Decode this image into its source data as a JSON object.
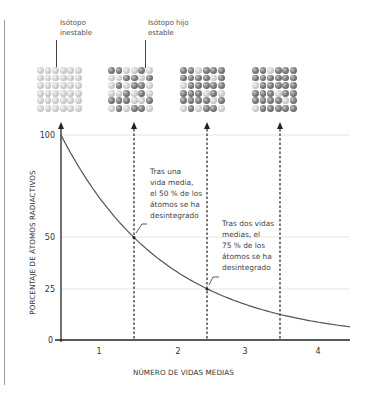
{
  "labels": {
    "unstable_isotope": [
      "Isótopo",
      "inestable"
    ],
    "daughter_isotope": [
      "Isótopo hijo",
      "estable"
    ]
  },
  "annotations": {
    "one_half_life": [
      "Tras una",
      "vida media,",
      "el 50 % de los",
      "átomos se ha",
      "desintegrado"
    ],
    "two_half_lives": [
      "Tras dos vidas",
      "medias, el",
      "75 % de los",
      "átomos se ha",
      "desintegrado"
    ]
  },
  "atom_grids": [
    {
      "name": "grid-0-half-lives",
      "rows": [
        "LLLLLL",
        "LLLLLL",
        "LLLLLL",
        "LLLLLL",
        "LLLLLL",
        "LLLLLL"
      ]
    },
    {
      "name": "grid-1-half-life",
      "rows": [
        "DDLLDL",
        "LLDDLD",
        "LDLDDL",
        "LLDLDL",
        "DDDLLD",
        "LDLDDL"
      ]
    },
    {
      "name": "grid-2-half-lives",
      "rows": [
        "DDLDDD",
        "DDDDLD",
        "LDDDDD",
        "DDDLDL",
        "DDDDLD",
        "LDLDDL"
      ]
    },
    {
      "name": "grid-3-half-lives",
      "rows": [
        "DDLDDD",
        "DDDDDD",
        "LDDDDD",
        "DDDLDD",
        "DDDDLD",
        "LDDDDD"
      ]
    }
  ],
  "colors": {
    "unstable_atom": "#c8c8c8",
    "stable_atom": "#6e6e6e",
    "axis": "#222222",
    "curve": "#555555",
    "gridline": "#e6e6e6"
  },
  "chart_data": {
    "type": "line",
    "title": "",
    "xlabel": "NÚMERO DE VIDAS MEDIAS",
    "ylabel": "PORCENTAJE DE ÁTOMOS RADIACTIVOS",
    "x_tick_labels": [
      "1",
      "2",
      "3",
      "4"
    ],
    "y_tick_labels": [
      "0",
      "25",
      "50",
      "100"
    ],
    "y_ticks": [
      0,
      25,
      50,
      100
    ],
    "ylim": [
      0,
      100
    ],
    "xlim": [
      0,
      4
    ],
    "grid": "horizontal at 25, 50, 100",
    "series": [
      {
        "name": "Átomos radiactivos restantes (%)",
        "x": [
          0,
          0.5,
          1,
          1.5,
          2,
          2.5,
          3,
          3.5,
          4
        ],
        "values": [
          100,
          71,
          50,
          35,
          25,
          18,
          12.5,
          9,
          6.25
        ]
      }
    ],
    "markers": [
      {
        "x": 1,
        "y": 50,
        "label": "Tras una vida media, el 50 % de los átomos se ha desintegrado"
      },
      {
        "x": 2,
        "y": 25,
        "label": "Tras dos vidas medias, el 75 % de los átomos se ha desintegrado"
      }
    ],
    "vertical_dashed_lines_at": [
      1,
      2,
      3
    ]
  }
}
